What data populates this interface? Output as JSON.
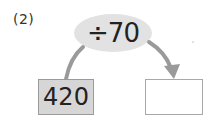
{
  "problem": {
    "number_label": "(2)",
    "operation": "÷70",
    "input_value": "420",
    "output_value": ""
  },
  "colors": {
    "ellipse_fill": "#e2e2e2",
    "arrow": "#999999",
    "input_box_fill": "#d6d6d6",
    "output_box_fill": "#ffffff"
  }
}
